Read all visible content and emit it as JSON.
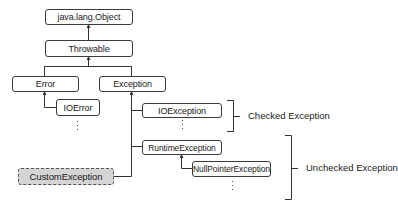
{
  "diagram": {
    "nodes": {
      "object": "java.lang.Object",
      "throwable": "Throwable",
      "error": "Error",
      "exception": "Exception",
      "ioerror": "IOError",
      "ioexception": "IOException",
      "runtime": "RuntimeException",
      "nullpointer": "NullPointerException",
      "custom": "CustomException"
    },
    "groups": {
      "checked": "Checked Exception",
      "unchecked": "Unchecked Exception"
    },
    "colors": {
      "line": "#333333",
      "custom_fill": "#d4d4d4",
      "node_border": "#3a3a3a"
    }
  }
}
